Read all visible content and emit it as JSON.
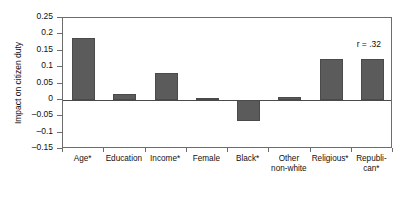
{
  "chart_data": {
    "type": "bar",
    "title": "",
    "xlabel": "",
    "ylabel": "Impact on citizen duty",
    "ylim": [
      -0.15,
      0.25
    ],
    "yticks": [
      0.25,
      0.2,
      0.15,
      0.1,
      0.05,
      0,
      -0.05,
      -0.1,
      -0.15
    ],
    "ytick_labels": [
      "0.25",
      "0.2",
      "0.15",
      "0.1",
      "0.05",
      "0",
      "–0.05",
      "–0.1",
      "–0.15"
    ],
    "grid": false,
    "legend": "none",
    "categories": [
      "Age*",
      "Education",
      "Income*",
      "Female",
      "Black*",
      "Other\nnon-white",
      "Religious*",
      "Republi-\ncan*"
    ],
    "values": [
      0.19,
      0.017,
      0.082,
      0.005,
      -0.065,
      0.008,
      0.125,
      0.125
    ],
    "annotations": [
      {
        "text": "r = .32",
        "position": "top-right"
      }
    ],
    "bar_color": "#5b5b5b",
    "bar_edge_color": "#4a4a4a",
    "axis_color": "#6d6d6d",
    "background": "#ffffff"
  }
}
